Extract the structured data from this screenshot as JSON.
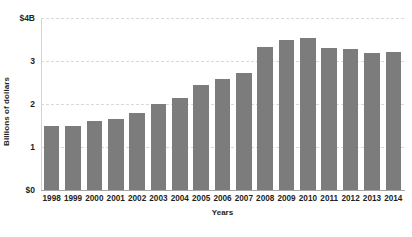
{
  "chart_data": {
    "type": "bar",
    "title": "",
    "subtitle": "",
    "xlabel": "Years",
    "ylabel": "Billions of dollars",
    "categories": [
      "1998",
      "1999",
      "2000",
      "2001",
      "2002",
      "2003",
      "2004",
      "2005",
      "2006",
      "2007",
      "2008",
      "2009",
      "2010",
      "2011",
      "2012",
      "2013",
      "2014"
    ],
    "values": [
      1.5,
      1.5,
      1.6,
      1.65,
      1.8,
      2.0,
      2.14,
      2.44,
      2.58,
      2.72,
      3.33,
      3.49,
      3.53,
      3.3,
      3.28,
      3.19,
      3.21
    ],
    "ylim": [
      0,
      4
    ],
    "yticks": [
      0,
      1,
      2,
      3,
      4
    ],
    "ytick_labels": [
      "$0",
      "1",
      "2",
      "3",
      "$4B"
    ],
    "grid": true,
    "legend": false,
    "legend_position": "none",
    "series": [
      {
        "name": "Spending",
        "color": "#7c7c7c",
        "values": [
          1.5,
          1.5,
          1.6,
          1.65,
          1.8,
          2.0,
          2.14,
          2.44,
          2.58,
          2.72,
          3.33,
          3.49,
          3.53,
          3.3,
          3.28,
          3.19,
          3.21
        ]
      }
    ]
  },
  "axes": {
    "y_title": "Billions of dollars",
    "x_title": "Years"
  },
  "colors": {
    "bar": "#7c7c7c",
    "grid": "#d9d9d9",
    "axis": "#a7a7a7",
    "text": "#231f20",
    "background": "#ffffff"
  }
}
